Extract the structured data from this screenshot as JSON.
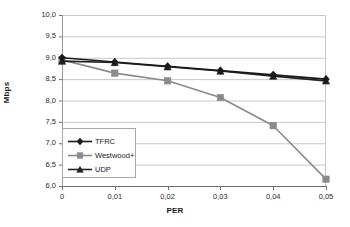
{
  "chart_data": {
    "type": "line",
    "title": "",
    "xlabel": "PER",
    "ylabel": "Mbps",
    "xlim": [
      0,
      0.05
    ],
    "ylim": [
      6.0,
      10.0
    ],
    "grid": "horizontal",
    "legend_position": "inside-lower-left",
    "x": [
      0,
      0.01,
      0.02,
      0.03,
      0.04,
      0.05
    ],
    "xtick_labels": [
      "0",
      "0,01",
      "0,02",
      "0,03",
      "0,04",
      "0,05"
    ],
    "ytick_values": [
      6.0,
      6.5,
      7.0,
      7.5,
      8.0,
      8.5,
      9.0,
      9.5,
      10.0
    ],
    "ytick_labels": [
      "6,0",
      "6,5",
      "7,0",
      "7,5",
      "8,0",
      "8,5",
      "9,0",
      "9,5",
      "10,0"
    ],
    "series": [
      {
        "name": "TFRC",
        "color": "#1a1a1a",
        "marker": "diamond",
        "values": [
          9.0,
          8.9,
          8.8,
          8.7,
          8.6,
          8.5
        ]
      },
      {
        "name": "Westwood+",
        "color": "#8a8a8a",
        "marker": "square",
        "values": [
          8.95,
          8.64,
          8.46,
          8.07,
          7.41,
          6.16
        ]
      },
      {
        "name": "UDP",
        "color": "#222222",
        "marker": "triangle",
        "values": [
          8.92,
          8.89,
          8.79,
          8.69,
          8.57,
          8.46
        ]
      }
    ]
  },
  "legend": {
    "items": [
      {
        "label": "TFRC"
      },
      {
        "label": "Westwood+"
      },
      {
        "label": "UDP"
      }
    ]
  },
  "axes": {
    "x_title": "PER",
    "y_title": "Mbps"
  }
}
